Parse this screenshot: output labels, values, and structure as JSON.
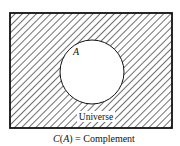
{
  "diagram": {
    "type": "venn",
    "universe_label": "Universe",
    "set_label": "A",
    "caption": "C(A) = Complement",
    "caption_parts": {
      "func": "C",
      "arg": "A",
      "rest": " = Complement"
    },
    "shaded_region": "complement of A",
    "colors": {
      "stroke": "#111111",
      "hatch": "#222222",
      "background": "#ffffff"
    }
  }
}
